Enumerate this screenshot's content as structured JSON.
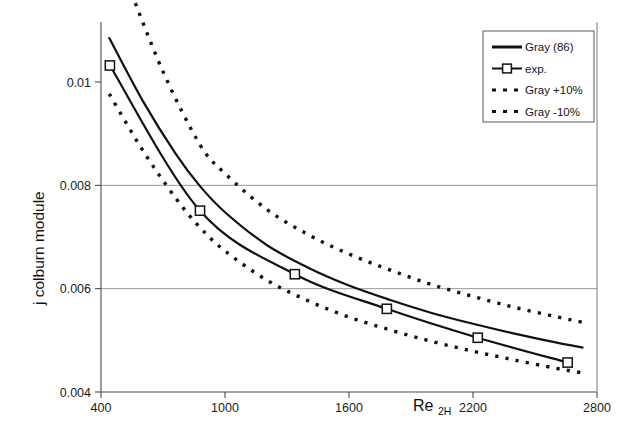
{
  "chart_data": {
    "type": "line",
    "title": "",
    "xlabel": "Re2H",
    "xlabel_base": "Re",
    "xlabel_sub": "2H",
    "ylabel": "j colburn module",
    "xlim": [
      400,
      2800
    ],
    "ylim": [
      0.004,
      0.0112
    ],
    "xticks": [
      400,
      1000,
      1600,
      2200,
      2800
    ],
    "xtick_labels": [
      "400",
      "1000",
      "1600",
      "2200",
      "2800"
    ],
    "yticks": [
      0.004,
      0.006,
      0.008,
      0.01
    ],
    "ytick_labels": [
      "0.004",
      "0.006",
      "0.008",
      "0.01"
    ],
    "grid": "horizontal gridlines at 0.006 and 0.008",
    "legend_position": "top-right",
    "series": [
      {
        "name": "Gray (86)",
        "style": "solid",
        "marker": "none",
        "color": "#111111",
        "x": [
          440,
          600,
          760,
          880,
          1000,
          1200,
          1400,
          1600,
          1800,
          2000,
          2200,
          2400,
          2600,
          2730
        ],
        "y": [
          0.01085,
          0.00965,
          0.00862,
          0.00798,
          0.00748,
          0.00685,
          0.00641,
          0.00606,
          0.00578,
          0.00553,
          0.00532,
          0.00513,
          0.00496,
          0.00486
        ]
      },
      {
        "name": "exp.",
        "style": "solid",
        "marker": "open-square",
        "color": "#111111",
        "x": [
          443,
          879,
          1338,
          1783,
          2223,
          2658
        ],
        "y": [
          0.01032,
          0.00751,
          0.00628,
          0.00561,
          0.00505,
          0.00457
        ]
      },
      {
        "name": "Gray +10%",
        "style": "dashed",
        "marker": "none",
        "color": "#111111",
        "x": [
          530,
          700,
          880,
          1000,
          1200,
          1400,
          1600,
          1800,
          2000,
          2200,
          2400,
          2600,
          2730
        ],
        "y": [
          0.0119,
          0.0102,
          0.00878,
          0.00823,
          0.00754,
          0.00705,
          0.00667,
          0.00636,
          0.00608,
          0.00585,
          0.00564,
          0.00546,
          0.00535
        ]
      },
      {
        "name": "Gray -10%",
        "style": "dashed",
        "marker": "none",
        "color": "#111111",
        "x": [
          440,
          600,
          760,
          880,
          1000,
          1200,
          1400,
          1600,
          1800,
          2000,
          2200,
          2400,
          2600,
          2730
        ],
        "y": [
          0.00977,
          0.00869,
          0.00776,
          0.00718,
          0.00673,
          0.00617,
          0.00577,
          0.00545,
          0.0052,
          0.00498,
          0.00479,
          0.00462,
          0.00446,
          0.00437
        ]
      }
    ]
  },
  "legend": {
    "items": [
      {
        "label": "Gray (86)",
        "style": "solid"
      },
      {
        "label": "exp.",
        "style": "solid-marker"
      },
      {
        "label": "Gray +10%",
        "style": "dashed"
      },
      {
        "label": "Gray -10%",
        "style": "dashed"
      }
    ]
  },
  "colors": {
    "line": "#111111",
    "grid": "#8c8c8c",
    "axis": "#3a3a3a",
    "background": "#ffffff"
  }
}
